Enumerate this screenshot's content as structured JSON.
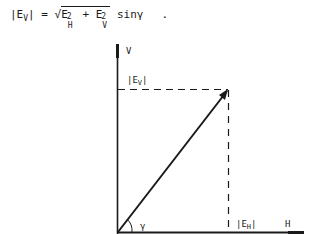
{
  "formula": {
    "lhs_open": "|E",
    "lhs_sub": "V",
    "lhs_close": "|",
    "equals": " = ",
    "sqrt_symbol": "√",
    "term1": "E",
    "term1_sub": "H",
    "term1_sup": "2",
    "plus": " + ",
    "term2": "E",
    "term2_sub": "V",
    "term2_sup": "2",
    "tail": " sinγ",
    "period": "."
  },
  "diagram": {
    "axis_v_label": "V",
    "axis_h_label": "H",
    "ev_label": "|E",
    "ev_label_sub": "V",
    "ev_label_close": "|",
    "eh_label": "|E",
    "eh_label_sub": "H",
    "eh_label_close": "|",
    "angle_label": "γ"
  }
}
